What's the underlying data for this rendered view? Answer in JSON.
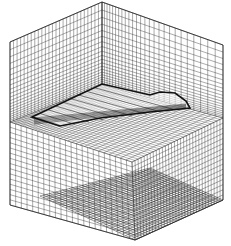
{
  "figure": {
    "background": "#ffffff",
    "line_color": "#222222",
    "wing_color": "#111111"
  },
  "patches": [
    {
      "name": "left-back-wall",
      "corners": [
        [
          10,
          42
        ],
        [
          102,
          2
        ],
        [
          102,
          85
        ],
        [
          10,
          122
        ]
      ],
      "nu": 26,
      "nv": 20,
      "cluster_u": 0.0,
      "cluster_v": 1.6,
      "stroke": 0.45
    },
    {
      "name": "right-back-wall",
      "corners": [
        [
          102,
          2
        ],
        [
          223,
          45
        ],
        [
          223,
          118
        ],
        [
          102,
          85
        ]
      ],
      "nu": 26,
      "nv": 20,
      "cluster_u": -1.2,
      "cluster_v": 1.6,
      "stroke": 0.45
    },
    {
      "name": "wing-level-plane",
      "corners": [
        [
          10,
          122
        ],
        [
          102,
          85
        ],
        [
          223,
          118
        ],
        [
          132,
          162
        ]
      ],
      "nu": 30,
      "nv": 34,
      "cluster_u": 0.0,
      "cluster_v": -1.2,
      "stroke": 0.4
    },
    {
      "name": "left-front-face",
      "corners": [
        [
          10,
          122
        ],
        [
          132,
          162
        ],
        [
          135,
          240
        ],
        [
          10,
          205
        ]
      ],
      "nu": 22,
      "nv": 16,
      "cluster_u": 0.0,
      "cluster_v": 0.0,
      "stroke": 0.45
    },
    {
      "name": "right-front-face",
      "corners": [
        [
          132,
          162
        ],
        [
          223,
          118
        ],
        [
          223,
          200
        ],
        [
          135,
          240
        ]
      ],
      "nu": 30,
      "nv": 16,
      "cluster_u": 0.0,
      "cluster_v": 0.0,
      "stroke": 0.45
    },
    {
      "name": "bottom-plane",
      "corners": [
        [
          40,
          196
        ],
        [
          150,
          168
        ],
        [
          223,
          200
        ],
        [
          135,
          240
        ]
      ],
      "nu": 34,
      "nv": 30,
      "cluster_u": 0.0,
      "cluster_v": 0.0,
      "stroke": 0.5
    }
  ],
  "wing": {
    "upper_outline": [
      [
        32,
        117
      ],
      [
        102,
        84
      ],
      [
        150,
        95
      ],
      [
        160,
        92
      ],
      [
        175,
        93
      ],
      [
        186,
        101
      ],
      [
        190,
        108
      ]
    ],
    "lower_outline": [
      [
        190,
        108
      ],
      [
        150,
        112
      ],
      [
        100,
        118
      ],
      [
        60,
        126
      ],
      [
        32,
        117
      ]
    ],
    "chord_lines": 9
  },
  "edges": [
    [
      [
        102,
        2
      ],
      [
        102,
        85
      ]
    ],
    [
      [
        10,
        42
      ],
      [
        102,
        2
      ]
    ],
    [
      [
        102,
        2
      ],
      [
        223,
        45
      ]
    ],
    [
      [
        10,
        42
      ],
      [
        10,
        205
      ]
    ],
    [
      [
        223,
        45
      ],
      [
        223,
        200
      ]
    ],
    [
      [
        10,
        205
      ],
      [
        135,
        240
      ]
    ],
    [
      [
        135,
        240
      ],
      [
        223,
        200
      ]
    ]
  ]
}
